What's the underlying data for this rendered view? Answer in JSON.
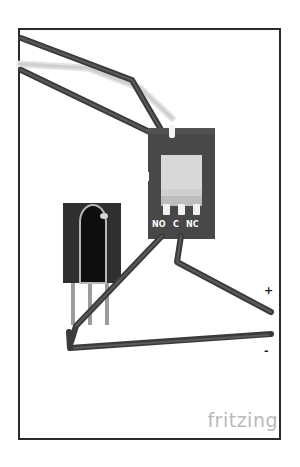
{
  "document": {
    "type": "fritzing-breadboard-sketch",
    "watermark": "fritzing",
    "background_color": "#ffffff",
    "frame_color": "#2b2b2b"
  },
  "components": [
    {
      "id": "relay-module",
      "name": "Relay Module",
      "board_color": "#484848",
      "relay_body_color": "#c9c9c9",
      "pin_color": "#f2f2f2",
      "pins": [
        {
          "label": "NO",
          "name": "normally-open"
        },
        {
          "label": "C",
          "name": "common"
        },
        {
          "label": "NC",
          "name": "normally-closed"
        }
      ]
    },
    {
      "id": "ir-receiver",
      "name": "IR Receiver",
      "body_color": "#2e2e2e",
      "dome_color": "#121212",
      "lead_color": "#9a9a9a",
      "lead_count": 3
    }
  ],
  "wires": [
    {
      "id": "wire-top-1",
      "color": "#3a3a3a",
      "name": "signal-wire-upper"
    },
    {
      "id": "wire-top-2",
      "color": "#3a3a3a",
      "name": "signal-wire-lower"
    },
    {
      "id": "wire-top-light",
      "color": "#dcdcdc",
      "name": "signal-wire-light"
    },
    {
      "id": "wire-no",
      "color": "#3a3a3a",
      "name": "no-terminal-wire"
    },
    {
      "id": "wire-c",
      "color": "#3a3a3a",
      "name": "common-terminal-wire"
    },
    {
      "id": "wire-ground",
      "color": "#3a3a3a",
      "name": "ground-wire"
    }
  ],
  "labels": {
    "pin_no": "NO",
    "pin_c": "C",
    "pin_nc": "NC",
    "positive": "+",
    "negative": "-"
  }
}
